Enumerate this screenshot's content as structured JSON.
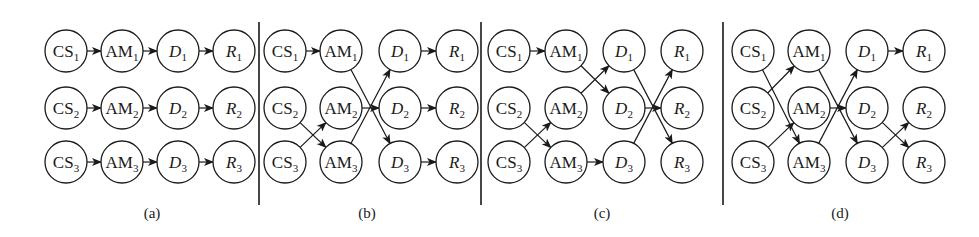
{
  "figure": {
    "stroke_color": "#1a1a1a",
    "background": "#ffffff",
    "node_radius": 21,
    "row_y": [
      51,
      108,
      162
    ],
    "caption_y": 218,
    "dividers": [
      {
        "x": 259,
        "y1": 22,
        "y2": 205
      },
      {
        "x": 481,
        "y1": 22,
        "y2": 205
      },
      {
        "x": 723,
        "y1": 22,
        "y2": 205
      }
    ],
    "node_types": [
      {
        "key": "CS",
        "label": "CS",
        "italic": false
      },
      {
        "key": "AM",
        "label": "AM",
        "italic": false
      },
      {
        "key": "D",
        "label": "D",
        "italic": true
      },
      {
        "key": "R",
        "label": "R",
        "italic": true
      }
    ],
    "panels": [
      {
        "id": "a",
        "caption": "(a)",
        "caption_x": 152,
        "column_x": [
          66,
          122,
          178,
          234
        ],
        "edges": [
          [
            "CS1",
            "AM1"
          ],
          [
            "CS2",
            "AM2"
          ],
          [
            "CS3",
            "AM3"
          ],
          [
            "AM1",
            "D1"
          ],
          [
            "AM2",
            "D2"
          ],
          [
            "AM3",
            "D3"
          ],
          [
            "D1",
            "R1"
          ],
          [
            "D2",
            "R2"
          ],
          [
            "D3",
            "R3"
          ]
        ]
      },
      {
        "id": "b",
        "caption": "(b)",
        "caption_x": 367,
        "column_x": [
          285,
          341,
          400,
          457
        ],
        "edges": [
          [
            "CS1",
            "AM1"
          ],
          [
            "CS2",
            "AM3"
          ],
          [
            "CS3",
            "AM2"
          ],
          [
            "AM1",
            "D3"
          ],
          [
            "AM2",
            "D2"
          ],
          [
            "AM3",
            "D1"
          ],
          [
            "D1",
            "R1"
          ],
          [
            "D2",
            "R2"
          ],
          [
            "D3",
            "R3"
          ]
        ]
      },
      {
        "id": "c",
        "caption": "(c)",
        "caption_x": 602,
        "column_x": [
          509,
          566,
          624,
          682
        ],
        "edges": [
          [
            "CS1",
            "AM1"
          ],
          [
            "CS2",
            "AM3"
          ],
          [
            "CS3",
            "AM2"
          ],
          [
            "AM1",
            "D2"
          ],
          [
            "AM2",
            "D1"
          ],
          [
            "AM3",
            "D3"
          ],
          [
            "D1",
            "R3"
          ],
          [
            "D2",
            "R2"
          ],
          [
            "D3",
            "R1"
          ]
        ]
      },
      {
        "id": "d",
        "caption": "(d)",
        "caption_x": 840,
        "column_x": [
          753,
          809,
          867,
          924
        ],
        "edges": [
          [
            "CS1",
            "AM3"
          ],
          [
            "CS2",
            "AM1"
          ],
          [
            "CS3",
            "AM2"
          ],
          [
            "AM1",
            "D3"
          ],
          [
            "AM2",
            "D2"
          ],
          [
            "AM3",
            "D1"
          ],
          [
            "D1",
            "R1"
          ],
          [
            "D2",
            "R3"
          ],
          [
            "D3",
            "R2"
          ]
        ]
      }
    ]
  }
}
